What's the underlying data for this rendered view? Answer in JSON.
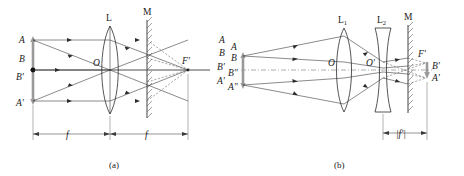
{
  "figure": {
    "type": "optics-ray-diagram",
    "panels": [
      {
        "id": "a",
        "caption": "(a)",
        "elements": {
          "object_labels": [
            "A",
            "B",
            "B'",
            "A'"
          ],
          "lens_label": "L",
          "lens_center_label": "O",
          "mirror_label": "M",
          "focus_label": "F'",
          "image_labels": [
            "A",
            "B",
            "B'",
            "A'"
          ],
          "dimensions": [
            "f",
            "f"
          ]
        }
      },
      {
        "id": "b",
        "caption": "(b)",
        "elements": {
          "object_labels": [
            "A",
            "B",
            "B\"",
            "A\""
          ],
          "lens1_label": "L",
          "lens1_sub": "1",
          "lens2_label": "L",
          "lens2_sub": "2",
          "lens1_center_label": "O",
          "lens2_center_label": "O'",
          "mirror_label": "M",
          "focus_label": "F'",
          "image_labels": [
            "B'",
            "A'"
          ],
          "dimensions": [
            "|f'|"
          ]
        }
      }
    ]
  },
  "colors": {
    "background": "#ffffff",
    "ray": "#2b2b2b",
    "object": "#9a9a9a",
    "mirror": "#555555",
    "axis": "#3a3a3a"
  }
}
